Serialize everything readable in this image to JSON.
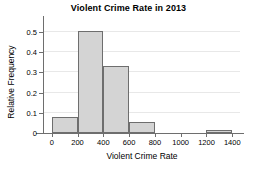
{
  "chart_data": {
    "type": "bar",
    "title": "Violent Crime Rate in 2013",
    "xlabel": "Violent Crime Rate",
    "ylabel": "Relative Frequency",
    "xlim": [
      -60,
      1460
    ],
    "ylim": [
      0,
      0.55
    ],
    "grid": true,
    "legend": null,
    "bin_width": 200,
    "bin_edges": [
      0,
      200,
      400,
      600,
      800,
      1000,
      1200,
      1400
    ],
    "categories": [
      "0-200",
      "200-400",
      "400-600",
      "600-800",
      "800-1000",
      "1000-1200",
      "1200-1400"
    ],
    "values": [
      0.08,
      0.505,
      0.33,
      0.055,
      0,
      0,
      0.015
    ],
    "xticks": [
      0,
      200,
      400,
      600,
      800,
      1000,
      1200,
      1400
    ],
    "xtick_labels": [
      "0",
      "200",
      "400",
      "600",
      "800",
      "1000",
      "1200",
      "1400"
    ],
    "yticks": [
      0,
      0.1,
      0.2,
      0.3,
      0.4,
      0.5
    ],
    "ytick_labels": [
      "0",
      "0.1",
      "0.2",
      "0.3",
      "0.4",
      "0.5"
    ],
    "bar_fill_color": "#d4d4d4",
    "bar_edge_color": "#6e6e6e",
    "grid_color": "#e8e8e8",
    "axis_color": "#6e6e6e",
    "background_color": "#ffffff"
  }
}
